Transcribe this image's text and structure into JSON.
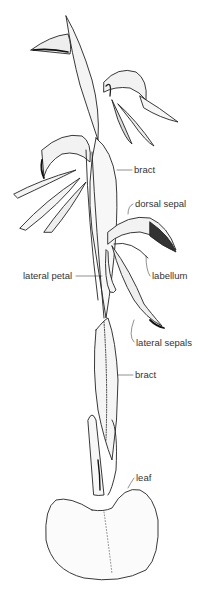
{
  "diagram": {
    "labels": [
      {
        "id": "bract-upper",
        "text": "bract",
        "x": 134,
        "y": 165
      },
      {
        "id": "dorsal-sepal",
        "text": "dorsal sepal",
        "x": 135,
        "y": 199
      },
      {
        "id": "lateral-petal",
        "text": "lateral petal",
        "x": 23,
        "y": 271
      },
      {
        "id": "labellum",
        "text": "labellum",
        "x": 152,
        "y": 271
      },
      {
        "id": "lateral-sepals",
        "text": "lateral sepals",
        "x": 136,
        "y": 338
      },
      {
        "id": "bract-lower",
        "text": "bract",
        "x": 135,
        "y": 370
      },
      {
        "id": "leaf",
        "text": "leaf",
        "x": 136,
        "y": 473
      }
    ]
  }
}
